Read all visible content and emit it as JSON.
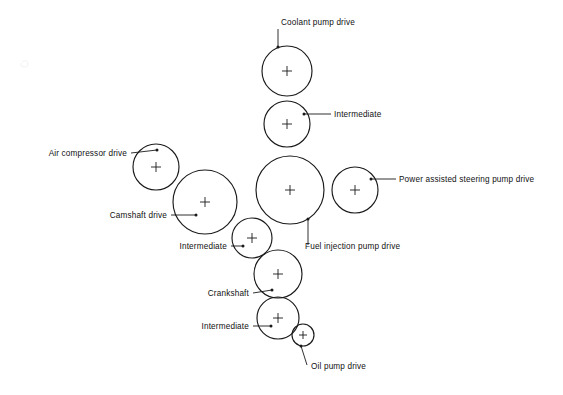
{
  "diagram": {
    "background_color": "#ffffff",
    "line_color": "#1a1a1a",
    "text_color": "#111111",
    "width": 563,
    "height": 395,
    "gears": [
      {
        "id": "coolant-pump-drive",
        "label": "Coolant pump drive",
        "cx": 287,
        "cy": 71,
        "r": 25,
        "cross_size": 5
      },
      {
        "id": "intermediate-top",
        "label": "Intermediate",
        "cx": 287,
        "cy": 124,
        "r": 23,
        "cross_size": 5
      },
      {
        "id": "fuel-injection-pump-drive",
        "label": "Fuel injection pump drive",
        "cx": 290,
        "cy": 190,
        "r": 34,
        "cross_size": 5
      },
      {
        "id": "power-assisted-steering-pump-drive",
        "label": "Power assisted steering pump drive",
        "cx": 355,
        "cy": 190,
        "r": 23,
        "cross_size": 5
      },
      {
        "id": "air-compressor-drive",
        "label": "Air compressor drive",
        "cx": 156,
        "cy": 167,
        "r": 23,
        "cross_size": 5
      },
      {
        "id": "camshaft-drive",
        "label": "Camshaft drive",
        "cx": 205,
        "cy": 202,
        "r": 32,
        "cross_size": 5
      },
      {
        "id": "intermediate-middle",
        "label": "Intermediate",
        "cx": 252,
        "cy": 238,
        "r": 20,
        "cross_size": 5
      },
      {
        "id": "crankshaft",
        "label": "Crankshaft",
        "cx": 278,
        "cy": 274,
        "r": 24,
        "cross_size": 5
      },
      {
        "id": "intermediate-bottom",
        "label": "Intermediate",
        "cx": 278,
        "cy": 318,
        "r": 21,
        "cross_size": 5
      },
      {
        "id": "oil-pump-drive",
        "label": "Oil pump drive",
        "cx": 303,
        "cy": 335,
        "r": 11,
        "cross_size": 4
      }
    ],
    "labels": [
      {
        "id": "coolant-pump-drive",
        "text": "Coolant pump drive",
        "text_x": 281,
        "text_y": 25,
        "anchor": "start",
        "leader": "M 278 29 L 278 47",
        "dot_x": 278,
        "dot_y": 47
      },
      {
        "id": "intermediate-top",
        "text": "Intermediate",
        "text_x": 334,
        "text_y": 117,
        "anchor": "start",
        "leader": "M 331 114 L 304 114",
        "dot_x": 304,
        "dot_y": 114
      },
      {
        "id": "air-compressor-drive",
        "text": "Air compressor drive",
        "text_x": 127,
        "text_y": 156,
        "anchor": "end",
        "leader": "M 131 153 L 157 150",
        "dot_x": 157,
        "dot_y": 150
      },
      {
        "id": "camshaft-drive",
        "text": "Camshaft drive",
        "text_x": 167,
        "text_y": 218,
        "anchor": "end",
        "leader": "M 171 215 L 196 215",
        "dot_x": 196,
        "dot_y": 215
      },
      {
        "id": "intermediate-middle",
        "text": "Intermediate",
        "text_x": 227,
        "text_y": 249,
        "anchor": "end",
        "leader": "M 231 246 L 243 246",
        "dot_x": 243,
        "dot_y": 246
      },
      {
        "id": "fuel-injection-pump-drive",
        "text": "Fuel injection pump drive",
        "text_x": 305,
        "text_y": 249,
        "anchor": "start",
        "leader": "M 308 245 L 308 219",
        "dot_x": 308,
        "dot_y": 219
      },
      {
        "id": "power-assisted-steering-pump-drive",
        "text": "Power assisted steering pump drive",
        "text_x": 399,
        "text_y": 182,
        "anchor": "start",
        "leader": "M 396 179 L 371 179",
        "dot_x": 371,
        "dot_y": 179
      },
      {
        "id": "crankshaft",
        "text": "Crankshaft",
        "text_x": 249,
        "text_y": 296,
        "anchor": "end",
        "leader": "M 253 293 L 272 290",
        "dot_x": 272,
        "dot_y": 290
      },
      {
        "id": "intermediate-bottom",
        "text": "Intermediate",
        "text_x": 249,
        "text_y": 329,
        "anchor": "end",
        "leader": "M 253 326 L 271 326",
        "dot_x": 271,
        "dot_y": 326
      },
      {
        "id": "oil-pump-drive",
        "text": "Oil pump drive",
        "text_x": 311,
        "text_y": 369,
        "anchor": "start",
        "leader": "M 307 365 L 301 346",
        "dot_x": 301,
        "dot_y": 346
      }
    ]
  }
}
